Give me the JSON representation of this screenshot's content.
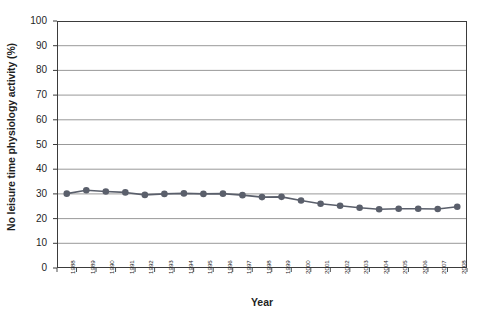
{
  "chart_data": {
    "type": "line",
    "title": "",
    "xlabel": "Year",
    "ylabel": "No leisure time physiology activity (%)",
    "ylim": [
      0,
      100
    ],
    "ytick_labels": [
      "0",
      "10",
      "20",
      "30",
      "40",
      "50",
      "60",
      "70",
      "80",
      "90",
      "100"
    ],
    "ytick_values": [
      0,
      10,
      20,
      30,
      40,
      50,
      60,
      70,
      80,
      90,
      100
    ],
    "grid": true,
    "grid_axis": "y",
    "legend": false,
    "marker": "circle",
    "series_color": "#5a5f6b",
    "categories": [
      "1988",
      "1989",
      "1990",
      "1991",
      "1992",
      "1993",
      "1994",
      "1995",
      "1996",
      "1997",
      "1998",
      "1999",
      "2000",
      "2001",
      "2002",
      "2003",
      "2004",
      "2005",
      "2006",
      "2007",
      "2008"
    ],
    "series": [
      {
        "name": "No leisure time physical activity",
        "values": [
          30.1,
          31.5,
          31.0,
          30.6,
          29.6,
          30.0,
          30.2,
          30.0,
          30.1,
          29.5,
          28.7,
          28.8,
          27.3,
          26.0,
          25.2,
          24.4,
          23.8,
          24.0,
          24.0,
          23.9,
          24.8
        ]
      }
    ]
  },
  "axis": {
    "x_title": "Year",
    "y_title": "No leisure time physiology activity (%)"
  }
}
